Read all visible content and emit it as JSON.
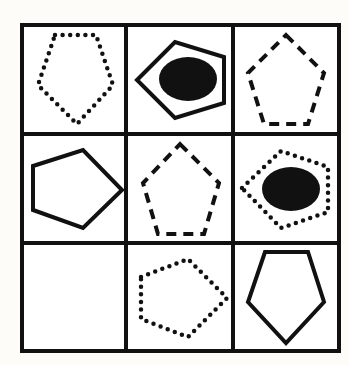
{
  "puzzle": {
    "title": "3x3 matrix pattern puzzle",
    "rows": 3,
    "cols": 3,
    "grid": {
      "x_lines": [
        22,
        126,
        233,
        339
      ],
      "y_lines": [
        25,
        134,
        243,
        351
      ],
      "line_color": "#111111",
      "background": "#ffffff"
    },
    "cells": [
      {
        "row": 1,
        "col": 1,
        "label": "dotted pentagon pointing down",
        "style": "dotted",
        "orientation": "down",
        "filled_ellipse": false,
        "points": "55,35 96,35 113,85 77,124 38,85"
      },
      {
        "row": 1,
        "col": 2,
        "label": "solid pentagon pointing left with black ellipse",
        "style": "solid",
        "orientation": "left",
        "filled_ellipse": true,
        "points": "137,80 175,42 224,57 224,103 175,118",
        "ellipse": {
          "cx": 188,
          "cy": 79,
          "rx": 29,
          "ry": 22
        }
      },
      {
        "row": 1,
        "col": 3,
        "label": "dashed pentagon pointing up",
        "style": "dashed",
        "orientation": "up",
        "filled_ellipse": false,
        "points": "286,35 324,73 308,124 264,124 248,73"
      },
      {
        "row": 2,
        "col": 1,
        "label": "solid pentagon pointing right",
        "style": "solid",
        "orientation": "right",
        "filled_ellipse": false,
        "points": "33,166 83,150 122,190 83,228 33,210"
      },
      {
        "row": 2,
        "col": 2,
        "label": "dashed pentagon pointing up",
        "style": "dashed",
        "orientation": "up",
        "filled_ellipse": false,
        "points": "180,144 219,183 204,234 158,234 143,183"
      },
      {
        "row": 2,
        "col": 3,
        "label": "dotted pentagon pointing left with black ellipse",
        "style": "dotted",
        "orientation": "left",
        "filled_ellipse": true,
        "points": "242,188 281,151 328,167 328,212 281,228",
        "ellipse": {
          "cx": 291,
          "cy": 189,
          "rx": 29,
          "ry": 22
        }
      },
      {
        "row": 3,
        "col": 1,
        "label": "empty cell (missing answer)",
        "style": "none",
        "orientation": "",
        "filled_ellipse": false
      },
      {
        "row": 3,
        "col": 2,
        "label": "dotted pentagon pointing right",
        "style": "dotted",
        "orientation": "right",
        "filled_ellipse": false,
        "points": "141,277 188,259 227,298 188,337 141,319"
      },
      {
        "row": 3,
        "col": 3,
        "label": "solid pentagon pointing down",
        "style": "solid",
        "orientation": "down",
        "filled_ellipse": false,
        "points": "265,252 308,252 324,302 286,343 248,302"
      }
    ]
  }
}
